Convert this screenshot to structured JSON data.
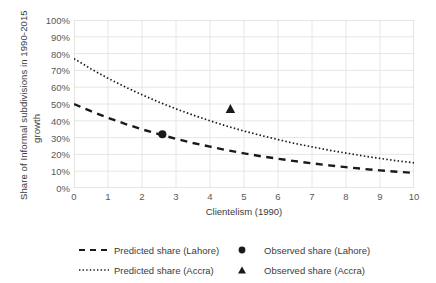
{
  "chart_data": {
    "type": "line",
    "title": "",
    "xlabel": "Clientelism (1990)",
    "ylabel_line1": "Share of Informal subdivisions in 1990-2015",
    "ylabel_line2": "growth",
    "xlim": [
      0,
      10
    ],
    "ylim": [
      0,
      100
    ],
    "grid": true,
    "x_ticks": [
      "0",
      "1",
      "2",
      "3",
      "4",
      "5",
      "6",
      "7",
      "8",
      "9",
      "10"
    ],
    "y_ticks": [
      "0%",
      "10%",
      "20%",
      "30%",
      "40%",
      "50%",
      "60%",
      "70%",
      "80%",
      "90%",
      "100%"
    ],
    "legend_position": "bottom",
    "series": [
      {
        "name": "Predicted share (Lahore)",
        "style": "dashed",
        "color": "#1a1a1a",
        "x": [
          0,
          0.5,
          1,
          1.5,
          2,
          2.5,
          3,
          3.5,
          4,
          4.5,
          5,
          5.5,
          6,
          6.5,
          7,
          7.5,
          8,
          8.5,
          9,
          9.5,
          10
        ],
        "values": [
          50,
          45.7,
          41.8,
          38.2,
          34.9,
          32.0,
          29.3,
          26.8,
          24.6,
          22.5,
          20.6,
          18.9,
          17.4,
          16.0,
          14.7,
          13.5,
          12.4,
          11.4,
          10.5,
          9.7,
          9.0
        ]
      },
      {
        "name": "Predicted share (Accra)",
        "style": "dotted",
        "color": "#1a1a1a",
        "x": [
          0,
          0.5,
          1,
          1.5,
          2,
          2.5,
          3,
          3.5,
          4,
          4.5,
          5,
          5.5,
          6,
          6.5,
          7,
          7.5,
          8,
          8.5,
          9,
          9.5,
          10
        ],
        "values": [
          77,
          70.9,
          65.3,
          60.2,
          55.5,
          51.1,
          47.1,
          43.4,
          40.0,
          36.8,
          33.9,
          31.3,
          28.8,
          26.5,
          24.5,
          22.5,
          20.8,
          19.1,
          17.6,
          16.2,
          15.0
        ]
      }
    ],
    "points": [
      {
        "name": "Observed share (Lahore)",
        "marker": "circle",
        "color": "#1a1a1a",
        "x": 2.6,
        "y": 32
      },
      {
        "name": "Observed share (Accra)",
        "marker": "triangle",
        "color": "#1a1a1a",
        "x": 4.6,
        "y": 47
      }
    ]
  },
  "legend": {
    "items": [
      {
        "label": "Predicted share (Lahore)",
        "marker": "dashed-line"
      },
      {
        "label": "Observed share (Lahore)",
        "marker": "circle"
      },
      {
        "label": "Predicted share (Accra)",
        "marker": "dotted-line"
      },
      {
        "label": "Observed share (Accra)",
        "marker": "triangle"
      }
    ]
  }
}
